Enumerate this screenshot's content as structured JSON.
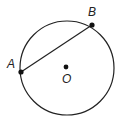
{
  "diagram": {
    "type": "circle-with-chord",
    "circle": {
      "center": "O",
      "cx": 67,
      "cy": 68,
      "r": 47
    },
    "points": [
      {
        "name": "A",
        "x": 21,
        "y": 72,
        "label": "A"
      },
      {
        "name": "B",
        "x": 92,
        "y": 25,
        "label": "B"
      },
      {
        "name": "O",
        "x": 66,
        "y": 67,
        "label": "O"
      }
    ],
    "segments": [
      {
        "from": "A",
        "to": "B"
      }
    ],
    "colors": {
      "stroke": "#222222",
      "background": "#ffffff"
    }
  }
}
